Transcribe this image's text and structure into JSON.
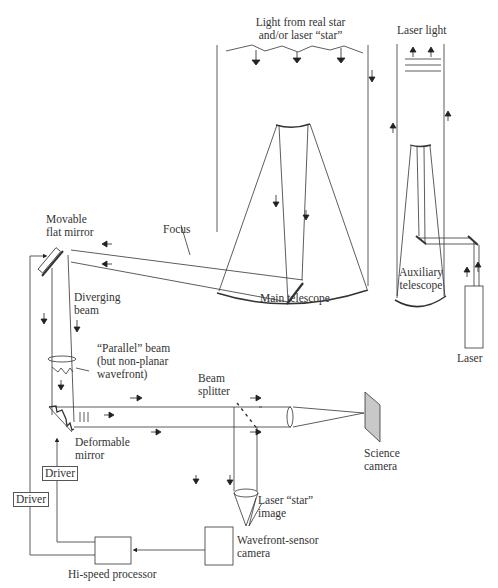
{
  "diagram": {
    "type": "adaptive-optics-system",
    "labels": {
      "light_from_star_line1": "Light from real star",
      "light_from_star_line2": "and/or laser “star”",
      "laser_light": "Laser light",
      "movable_mirror_line1": "Movable",
      "movable_mirror_line2": "flat mirror",
      "focus": "Focus",
      "main_telescope": "Main telescope",
      "auxiliary_line1": "Auxiliary",
      "auxiliary_line2": "telescope",
      "laser": "Laser",
      "diverging_line1": "Diverging",
      "diverging_line2": "beam",
      "parallel_line1": "“Parallel” beam",
      "parallel_line2": "(but non-planar",
      "parallel_line3": "wavefront)",
      "beam_splitter_line1": "Beam",
      "beam_splitter_line2": "splitter",
      "science_camera_line1": "Science",
      "science_camera_line2": "camera",
      "deformable_line1": "Deformable",
      "deformable_line2": "mirror",
      "driver_1": "Driver",
      "driver_2": "Driver",
      "laser_star_line1": "Laser “star”",
      "laser_star_line2": "image",
      "wavefront_line1": "Wavefront-sensor",
      "wavefront_line2": "camera",
      "processor": "Hi-speed processor"
    },
    "colors": {
      "line": "#333333",
      "science_camera_fill": "#c8c8c8"
    }
  }
}
